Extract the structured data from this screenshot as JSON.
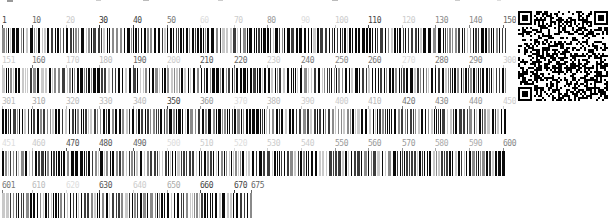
{
  "figure": {
    "background": "#ffffff"
  },
  "qr": {
    "name": "qr-code",
    "dark_color": "#000000",
    "light_color": "#ffffff"
  },
  "bar_palette": [
    "#0a0a0a",
    "#3c3c3c",
    "#8a8a8a",
    "#c9c9c9"
  ],
  "chart_data": {
    "type": "bar",
    "title": "",
    "xlabel": "position",
    "axis": {
      "range": [
        1,
        675
      ],
      "tick_interval": 10,
      "rows_wrap_at": 150
    },
    "note": "Each row is a dense strip of 1-3px vertical bars (black to light gray); individual bar values are below label resolution. Tick labels vary from black to light gray.",
    "rows": [
      {
        "start": 1,
        "end": 150,
        "ticks": [
          {
            "label": "1",
            "color": "#444444"
          },
          {
            "label": "10",
            "color": "#666666"
          },
          {
            "label": "20",
            "color": "#cccccc"
          },
          {
            "label": "30",
            "color": "#333333"
          },
          {
            "label": "40",
            "color": "#444444"
          },
          {
            "label": "50",
            "color": "#777777"
          },
          {
            "label": "60",
            "color": "#dddddd"
          },
          {
            "label": "70",
            "color": "#cccccc"
          },
          {
            "label": "80",
            "color": "#999999"
          },
          {
            "label": "90",
            "color": "#dddddd"
          },
          {
            "label": "100",
            "color": "#cccccc"
          },
          {
            "label": "110",
            "color": "#444444"
          },
          {
            "label": "120",
            "color": "#cccccc"
          },
          {
            "label": "130",
            "color": "#888888"
          },
          {
            "label": "140",
            "color": "#888888"
          },
          {
            "label": "150",
            "color": "#666666"
          }
        ]
      },
      {
        "start": 151,
        "end": 300,
        "ticks": [
          {
            "label": "151",
            "color": "#cccccc"
          },
          {
            "label": "160",
            "color": "#777777"
          },
          {
            "label": "170",
            "color": "#cccccc"
          },
          {
            "label": "180",
            "color": "#bbbbbb"
          },
          {
            "label": "190",
            "color": "#666666"
          },
          {
            "label": "200",
            "color": "#cccccc"
          },
          {
            "label": "210",
            "color": "#555555"
          },
          {
            "label": "220",
            "color": "#666666"
          },
          {
            "label": "230",
            "color": "#cccccc"
          },
          {
            "label": "240",
            "color": "#777777"
          },
          {
            "label": "250",
            "color": "#888888"
          },
          {
            "label": "260",
            "color": "#777777"
          },
          {
            "label": "270",
            "color": "#dddddd"
          },
          {
            "label": "280",
            "color": "#777777"
          },
          {
            "label": "290",
            "color": "#888888"
          },
          {
            "label": "300",
            "color": "#cccccc"
          }
        ]
      },
      {
        "start": 301,
        "end": 450,
        "ticks": [
          {
            "label": "301",
            "color": "#bbbbbb"
          },
          {
            "label": "310",
            "color": "#aaaaaa"
          },
          {
            "label": "320",
            "color": "#bbbbbb"
          },
          {
            "label": "330",
            "color": "#bbbbbb"
          },
          {
            "label": "340",
            "color": "#bbbbbb"
          },
          {
            "label": "350",
            "color": "#444444"
          },
          {
            "label": "360",
            "color": "#999999"
          },
          {
            "label": "370",
            "color": "#dddddd"
          },
          {
            "label": "380",
            "color": "#bbbbbb"
          },
          {
            "label": "390",
            "color": "#cccccc"
          },
          {
            "label": "400",
            "color": "#cccccc"
          },
          {
            "label": "410",
            "color": "#bbbbbb"
          },
          {
            "label": "420",
            "color": "#777777"
          },
          {
            "label": "430",
            "color": "#888888"
          },
          {
            "label": "440",
            "color": "#999999"
          },
          {
            "label": "450",
            "color": "#cccccc"
          }
        ]
      },
      {
        "start": 451,
        "end": 600,
        "ticks": [
          {
            "label": "451",
            "color": "#dddddd"
          },
          {
            "label": "460",
            "color": "#cccccc"
          },
          {
            "label": "470",
            "color": "#555555"
          },
          {
            "label": "480",
            "color": "#555555"
          },
          {
            "label": "490",
            "color": "#666666"
          },
          {
            "label": "500",
            "color": "#dddddd"
          },
          {
            "label": "510",
            "color": "#cccccc"
          },
          {
            "label": "520",
            "color": "#dddddd"
          },
          {
            "label": "530",
            "color": "#cccccc"
          },
          {
            "label": "540",
            "color": "#cccccc"
          },
          {
            "label": "550",
            "color": "#999999"
          },
          {
            "label": "560",
            "color": "#999999"
          },
          {
            "label": "570",
            "color": "#999999"
          },
          {
            "label": "580",
            "color": "#aaaaaa"
          },
          {
            "label": "590",
            "color": "#aaaaaa"
          },
          {
            "label": "600",
            "color": "#888888"
          }
        ]
      },
      {
        "start": 601,
        "end": 675,
        "ticks": [
          {
            "label": "601",
            "color": "#777777"
          },
          {
            "label": "610",
            "color": "#bbbbbb"
          },
          {
            "label": "620",
            "color": "#dddddd"
          },
          {
            "label": "630",
            "color": "#555555"
          },
          {
            "label": "640",
            "color": "#cccccc"
          },
          {
            "label": "650",
            "color": "#aaaaaa"
          },
          {
            "label": "660",
            "color": "#444444"
          },
          {
            "label": "670",
            "color": "#444444"
          },
          {
            "label": "675",
            "color": "#666666"
          }
        ]
      }
    ]
  }
}
